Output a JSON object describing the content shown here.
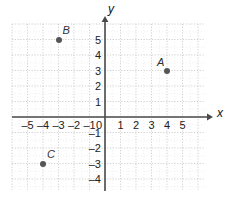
{
  "chart_data": {
    "type": "scatter",
    "title": "",
    "xlabel": "x",
    "ylabel": "y",
    "xlim": [
      -6.0,
      6.5
    ],
    "ylim": [
      -4.7,
      6.0
    ],
    "grid": true,
    "grid_step": 1,
    "legend": "none",
    "axis_arrows": [
      "x-positive",
      "y-positive"
    ],
    "origin_label": "0",
    "xticks": [
      -5,
      -4,
      -3,
      -2,
      -1,
      1,
      2,
      3,
      4,
      5
    ],
    "yticks": [
      -4,
      -3,
      -2,
      -1,
      1,
      2,
      3,
      4,
      5
    ],
    "xtick_labels": [
      "–5",
      "–4",
      "–3",
      "–2",
      "–1",
      "1",
      "2",
      "3",
      "4",
      "5"
    ],
    "ytick_labels": [
      "–4",
      "–3",
      "–2",
      "–1",
      "1",
      "2",
      "3",
      "4",
      "5"
    ],
    "points": [
      {
        "name": "A",
        "x": 4,
        "y": 3,
        "label_dx": -10,
        "label_dy": -14
      },
      {
        "name": "B",
        "x": -3,
        "y": 5,
        "label_dx": 4,
        "label_dy": -15
      },
      {
        "name": "C",
        "x": -4,
        "y": -3,
        "label_dx": 4,
        "label_dy": -15
      }
    ],
    "colors": {
      "point": "#555555",
      "axis": "#4a4a4a",
      "grid_major": "#cccccc",
      "grid_minor": "#e2e2e2",
      "text": "#222222",
      "background": "#ffffff"
    }
  },
  "geometry": {
    "origin_x": 105,
    "origin_y": 117,
    "unit": 15.5,
    "grid_left": 12,
    "grid_right": 205,
    "grid_top": 24,
    "grid_bottom": 190,
    "x_axis_arrow_end": 213,
    "y_axis_arrow_end": 16,
    "y_axis_bottom": 191
  },
  "axis_names": {
    "x": "x",
    "y": "y"
  }
}
